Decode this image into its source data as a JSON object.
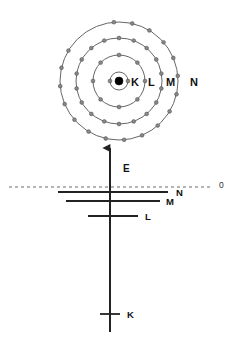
{
  "figure": {
    "colors": {
      "shell_stroke": "#555555",
      "electron_fill": "#888888",
      "electron_stroke": "#444444",
      "nucleus_fill": "#000000",
      "level_line": "#222222",
      "axis_line": "#222222",
      "zero_line": "#444444",
      "background": "#ffffff"
    }
  },
  "atom": {
    "center": {
      "x": 119,
      "y": 81
    },
    "nucleus": {
      "label": "nucleus",
      "radius": 4
    },
    "shells": [
      {
        "name": "K",
        "label": "K",
        "radius": 9,
        "electron_count": 2,
        "electron_angles": [
          180,
          0
        ],
        "label_pos": {
          "x": 131,
          "y": 86
        }
      },
      {
        "name": "L",
        "label": "L",
        "radius": 26,
        "electron_count": 8,
        "electron_angles": [
          90,
          45,
          0,
          315,
          270,
          225,
          180,
          135
        ],
        "label_pos": {
          "x": 148,
          "y": 86
        }
      },
      {
        "name": "M",
        "label": "M",
        "radius": 43,
        "electron_count": 18,
        "electron_angles": [
          90,
          70,
          50,
          30,
          10,
          350,
          330,
          310,
          290,
          270,
          250,
          230,
          210,
          190,
          170,
          150,
          130,
          110
        ],
        "label_pos": {
          "x": 166,
          "y": 86
        }
      },
      {
        "name": "N",
        "label": "N",
        "radius": 59,
        "electron_count": 18,
        "electron_angles": [
          95,
          77,
          59,
          41,
          23,
          5,
          347,
          329,
          311,
          293,
          275,
          257,
          239,
          221,
          203,
          185,
          167,
          149
        ],
        "label_pos": {
          "x": 190,
          "y": 86
        }
      }
    ]
  },
  "energy_diagram": {
    "axis": {
      "label": "E",
      "label_pos": {
        "x": 123,
        "y": 172
      },
      "x": 110,
      "top_y": 148,
      "bottom_y": 332,
      "arrow": "up"
    },
    "zero_line": {
      "label": "0",
      "label_pos": {
        "x": 219,
        "y": 188
      },
      "y": 187,
      "x_start": 9,
      "x_end": 210,
      "style": "dashed"
    },
    "levels": [
      {
        "name": "N",
        "label": "N",
        "y": 192,
        "x_start": 58,
        "x_end": 168,
        "label_pos": {
          "x": 176,
          "y": 196
        }
      },
      {
        "name": "M",
        "label": "M",
        "y": 201,
        "x_start": 66,
        "x_end": 160,
        "label_pos": {
          "x": 166,
          "y": 205
        }
      },
      {
        "name": "L",
        "label": "L",
        "y": 216,
        "x_start": 88,
        "x_end": 138,
        "label_pos": {
          "x": 145,
          "y": 220
        }
      },
      {
        "name": "K",
        "label": "K",
        "y": 314,
        "x_start": 100,
        "x_end": 120,
        "label_pos": {
          "x": 127,
          "y": 318
        }
      }
    ]
  },
  "chart_data": {
    "type": "diagram",
    "shell_names": [
      "K",
      "L",
      "M",
      "N"
    ],
    "shell_radii": [
      9,
      26,
      43,
      59
    ],
    "shell_electron_counts": [
      2,
      8,
      18,
      18
    ],
    "energy_level_names": [
      "N",
      "M",
      "L",
      "K"
    ],
    "energy_level_y": [
      192,
      201,
      216,
      314
    ],
    "zero_reference": "0",
    "energy_axis_label": "E"
  }
}
